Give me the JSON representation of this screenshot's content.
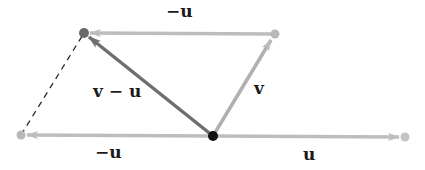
{
  "diagram": {
    "colors": {
      "background": "#ffffff",
      "u_vector": "#bdbdbd",
      "v_vector": "#b0b0b0",
      "v_minus_u_vector": "#6e6e6e",
      "dashed_line": "#2a2a2a",
      "origin_point": "#111111",
      "label_text": "#1a1a1a"
    },
    "points": {
      "origin": {
        "x": 213,
        "y": 136
      },
      "u_head": {
        "x": 405,
        "y": 137
      },
      "neg_u_head": {
        "x": 21,
        "y": 135
      },
      "v_head": {
        "x": 275,
        "y": 34
      },
      "v_minus_u_head": {
        "x": 84,
        "y": 33
      }
    },
    "labels": {
      "neg_u_top": "−u",
      "v_minus_u": "v − u",
      "v": "v",
      "neg_u_bottom": "−u",
      "u": "u"
    }
  }
}
